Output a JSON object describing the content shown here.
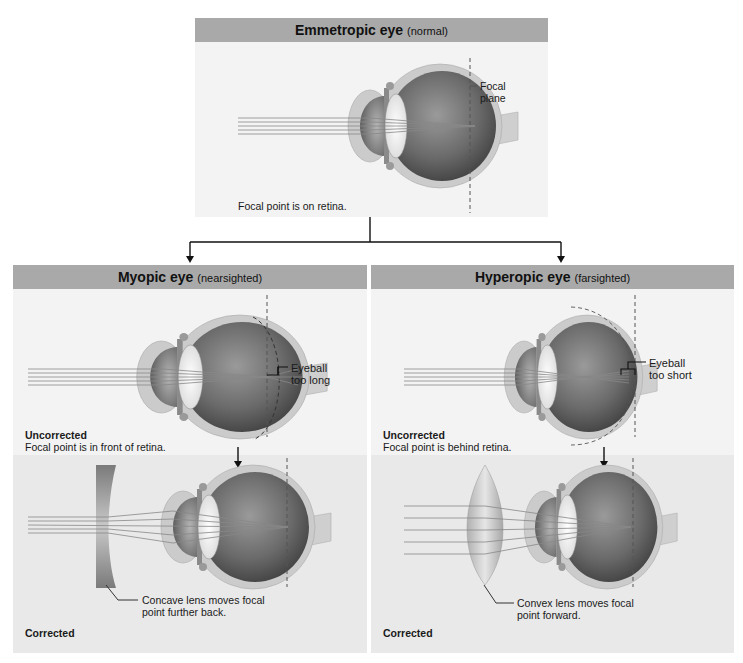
{
  "emmetropic": {
    "title": "Emmetropic eye",
    "subtitle": "(normal)",
    "focal_plane_label_line1": "Focal",
    "focal_plane_label_line2": "plane",
    "caption": "Focal point is on retina."
  },
  "myopic": {
    "title": "Myopic eye",
    "subtitle": "(nearsighted)",
    "annotation_line1": "Eyeball",
    "annotation_line2": "too long",
    "uncorrected_heading": "Uncorrected",
    "uncorrected_caption": "Focal point is in front of retina.",
    "lens_caption_line1": "Concave lens moves focal",
    "lens_caption_line2": "point further back.",
    "corrected_heading": "Corrected"
  },
  "hyperopic": {
    "title": "Hyperopic eye",
    "subtitle": "(farsighted)",
    "annotation_line1": "Eyeball",
    "annotation_line2": "too short",
    "uncorrected_heading": "Uncorrected",
    "uncorrected_caption": "Focal point is behind retina.",
    "lens_caption_line1": "Convex lens moves focal",
    "lens_caption_line2": "point forward.",
    "corrected_heading": "Corrected"
  },
  "colors": {
    "header_bg": "#a9a9a9",
    "panel_bg": "#f3f3f3",
    "corrected_bg": "#e9e9e9",
    "sclera": "#c9c9c9",
    "eye_interior": "#6b6b6b"
  }
}
